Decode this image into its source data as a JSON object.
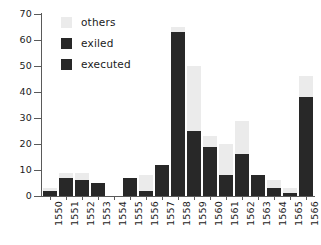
{
  "chart_data": {
    "type": "bar",
    "stacked": true,
    "title": "",
    "xlabel": "",
    "ylabel": "",
    "ylim": [
      0,
      70
    ],
    "ytick_values": [
      0,
      10,
      20,
      30,
      40,
      50,
      60,
      70
    ],
    "ytick_labels": [
      "0",
      "10",
      "20",
      "30",
      "40",
      "50",
      "60",
      "70"
    ],
    "grid": false,
    "legend_position": "top-left",
    "categories": [
      "1550",
      "1551",
      "1552",
      "1553",
      "1554",
      "1555",
      "1556",
      "1557",
      "1558",
      "1559",
      "1560",
      "1561",
      "1562",
      "1563",
      "1564",
      "1565",
      "1566"
    ],
    "series": [
      {
        "name": "executed",
        "color": "#282828",
        "values": [
          2,
          7,
          6,
          5,
          0,
          7,
          2,
          12,
          63,
          25,
          19,
          8,
          16,
          8,
          3,
          1,
          38
        ]
      },
      {
        "name": "exiled",
        "color": "#282828",
        "values": [
          0,
          0,
          0,
          0,
          0,
          0,
          0,
          0,
          0,
          0,
          0,
          0,
          0,
          0,
          0,
          0,
          0
        ]
      },
      {
        "name": "others",
        "color": "#ebebeb",
        "values": [
          1,
          2,
          3,
          0,
          0,
          0,
          6,
          0,
          2,
          25,
          4,
          12,
          13,
          0,
          3,
          2,
          8
        ]
      }
    ],
    "totals": [
      3,
      9,
      9,
      5,
      0,
      7,
      8,
      12,
      65,
      50,
      23,
      20,
      29,
      8,
      6,
      3,
      46
    ]
  },
  "legend": {
    "items": [
      {
        "label": "others",
        "color": "#ebebeb"
      },
      {
        "label": "exiled",
        "color": "#282828"
      },
      {
        "label": "executed",
        "color": "#282828"
      }
    ]
  },
  "axis": {
    "y_max": 70,
    "y_min": 0
  }
}
